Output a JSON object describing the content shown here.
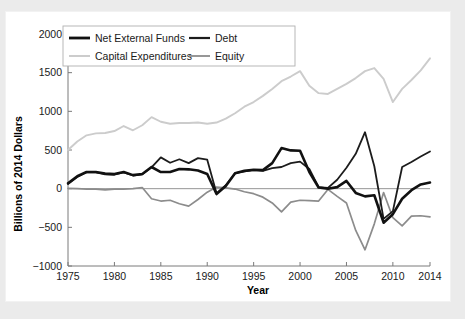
{
  "figure": {
    "background_color": "#ebebeb",
    "panel_color": "#ffffff"
  },
  "chart_data": {
    "type": "line",
    "title": "",
    "xlabel": "Year",
    "ylabel": "Billions of 2014 Dollars",
    "xlim": [
      1975,
      2014
    ],
    "ylim": [
      -1000,
      2000
    ],
    "yticks": [
      2000,
      1500,
      1000,
      500,
      0,
      -500,
      -1000
    ],
    "ytick_labels": [
      "2000",
      "1500",
      "1000",
      "500",
      "0",
      "−500",
      "−1000"
    ],
    "xticks": [
      1975,
      1980,
      1985,
      1990,
      1995,
      2000,
      2005,
      2010,
      2014
    ],
    "xtick_labels": [
      "1975",
      "1980",
      "1985",
      "1990",
      "1995",
      "2000",
      "2005",
      "2010",
      "2014"
    ],
    "grid": false,
    "zero_line": true,
    "legend_position": "upper-left",
    "x": [
      1975,
      1976,
      1977,
      1978,
      1979,
      1980,
      1981,
      1982,
      1983,
      1984,
      1985,
      1986,
      1987,
      1988,
      1989,
      1990,
      1991,
      1992,
      1993,
      1994,
      1995,
      1996,
      1997,
      1998,
      1999,
      2000,
      2001,
      2002,
      2003,
      2004,
      2005,
      2006,
      2007,
      2008,
      2009,
      2010,
      2011,
      2012,
      2013,
      2014
    ],
    "series": [
      {
        "name": "Net External Funds",
        "color": "#111111",
        "width": 2.6,
        "values": [
          70,
          160,
          215,
          215,
          195,
          190,
          215,
          175,
          190,
          280,
          215,
          215,
          255,
          250,
          235,
          190,
          -70,
          35,
          200,
          230,
          245,
          240,
          330,
          525,
          495,
          490,
          215,
          15,
          0,
          20,
          100,
          -55,
          -100,
          -85,
          -440,
          -330,
          -130,
          -20,
          55,
          80
        ]
      },
      {
        "name": "Debt",
        "color": "#1c1c1c",
        "width": 1.8,
        "values": [
          60,
          150,
          215,
          210,
          185,
          180,
          210,
          170,
          185,
          275,
          405,
          335,
          380,
          330,
          395,
          375,
          -60,
          45,
          200,
          225,
          240,
          230,
          265,
          280,
          330,
          350,
          255,
          20,
          10,
          115,
          270,
          450,
          730,
          290,
          -390,
          -290,
          280,
          345,
          415,
          480
        ]
      },
      {
        "name": "Capital Expenditures",
        "color": "#cccccc",
        "width": 1.9,
        "values": [
          500,
          610,
          690,
          715,
          720,
          745,
          810,
          755,
          820,
          925,
          865,
          840,
          850,
          850,
          855,
          840,
          855,
          905,
          975,
          1060,
          1120,
          1200,
          1290,
          1390,
          1450,
          1520,
          1330,
          1235,
          1225,
          1290,
          1355,
          1430,
          1520,
          1560,
          1420,
          1120,
          1290,
          1405,
          1530,
          1685
        ]
      },
      {
        "name": "Equity",
        "color": "#8c8c8c",
        "width": 1.7,
        "values": [
          5,
          0,
          -5,
          -5,
          -15,
          -5,
          -5,
          0,
          15,
          -130,
          -160,
          -150,
          -195,
          -225,
          -140,
          -45,
          20,
          10,
          -5,
          -40,
          -65,
          -110,
          -185,
          -300,
          -175,
          -150,
          -155,
          -160,
          -10,
          -100,
          -185,
          -540,
          -790,
          -455,
          -50,
          -375,
          -480,
          -355,
          -350,
          -365
        ]
      }
    ]
  },
  "legend": {
    "entries": [
      {
        "label": "Net External Funds",
        "color": "#111111",
        "width": 2.8
      },
      {
        "label": "Debt",
        "color": "#1c1c1c",
        "width": 2.2
      },
      {
        "label": "Capital Expenditures",
        "color": "#cccccc",
        "width": 2.0
      },
      {
        "label": "Equity",
        "color": "#8c8c8c",
        "width": 1.8
      }
    ]
  }
}
